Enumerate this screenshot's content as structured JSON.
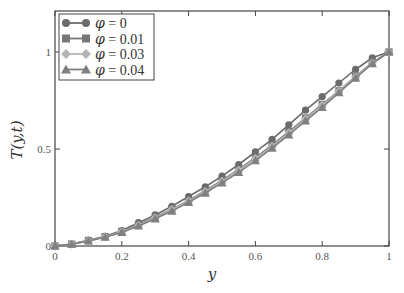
{
  "chart_data": {
    "type": "line",
    "title": "",
    "xlabel": "y",
    "ylabel": "T(y,t)",
    "xlim": [
      0,
      1
    ],
    "ylim": [
      0,
      1.2
    ],
    "grid": false,
    "legend_position": "upper left",
    "x_ticks": [
      "0",
      "0.2",
      "0.4",
      "0.6",
      "0.8",
      "1"
    ],
    "y_ticks": [
      "0",
      "0.5",
      "1"
    ],
    "x": [
      0,
      0.05,
      0.1,
      0.15,
      0.2,
      0.25,
      0.3,
      0.35,
      0.4,
      0.45,
      0.5,
      0.55,
      0.6,
      0.65,
      0.7,
      0.75,
      0.8,
      0.85,
      0.9,
      0.95,
      1.0
    ],
    "series": [
      {
        "name": "φ = 0",
        "marker": "circle",
        "color": "#6b6b6b",
        "values": [
          0,
          0.01,
          0.03,
          0.05,
          0.08,
          0.12,
          0.16,
          0.205,
          0.255,
          0.305,
          0.36,
          0.42,
          0.485,
          0.55,
          0.625,
          0.7,
          0.77,
          0.84,
          0.91,
          0.97,
          1.0
        ]
      },
      {
        "name": "φ = 0.01",
        "marker": "square",
        "color": "#777777",
        "values": [
          0,
          0.01,
          0.028,
          0.048,
          0.075,
          0.11,
          0.148,
          0.19,
          0.235,
          0.285,
          0.338,
          0.395,
          0.455,
          0.52,
          0.59,
          0.66,
          0.73,
          0.8,
          0.875,
          0.945,
          1.0
        ]
      },
      {
        "name": "φ = 0.03",
        "marker": "diamond",
        "color": "#b5b5b5",
        "values": [
          0,
          0.01,
          0.027,
          0.047,
          0.073,
          0.107,
          0.145,
          0.187,
          0.232,
          0.28,
          0.333,
          0.39,
          0.45,
          0.514,
          0.583,
          0.654,
          0.725,
          0.797,
          0.872,
          0.943,
          1.0
        ]
      },
      {
        "name": "φ = 0.04",
        "marker": "triangle",
        "color": "#808080",
        "values": [
          0,
          0.009,
          0.026,
          0.045,
          0.07,
          0.103,
          0.14,
          0.18,
          0.225,
          0.273,
          0.325,
          0.38,
          0.44,
          0.505,
          0.573,
          0.645,
          0.715,
          0.79,
          0.865,
          0.94,
          1.0
        ]
      }
    ]
  }
}
